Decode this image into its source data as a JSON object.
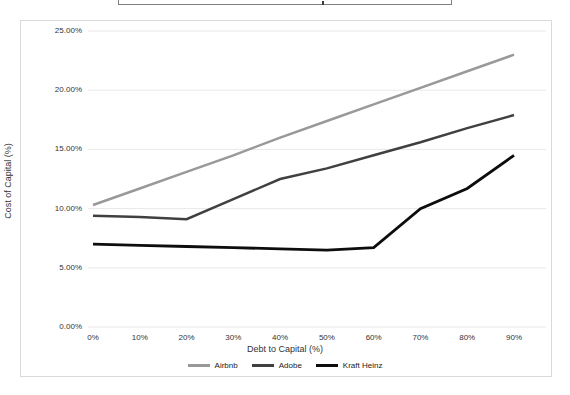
{
  "window": {
    "note_clipped_title_box": "title box cut off at top edge of screenshot"
  },
  "chart_data": {
    "type": "line",
    "title": "",
    "xlabel": "Debt to Capital (%)",
    "ylabel": "Cost of Capital (%)",
    "categories": [
      "0%",
      "10%",
      "20%",
      "30%",
      "40%",
      "50%",
      "60%",
      "70%",
      "80%",
      "90%"
    ],
    "y_tick_labels": [
      "0.00%",
      "5.00%",
      "10.00%",
      "15.00%",
      "20.00%",
      "25.00%"
    ],
    "y_tick_values": [
      0,
      5,
      10,
      15,
      20,
      25
    ],
    "ylim": [
      0,
      25
    ],
    "grid": true,
    "legend_position": "bottom",
    "colors": {
      "grid": "#e8e8e8",
      "text": "#333333",
      "panel_border": "#d9d9d9"
    },
    "series": [
      {
        "name": "Airbnb",
        "color": "#999999",
        "width": 2.5,
        "values": [
          10.3,
          11.7,
          13.1,
          14.5,
          16.0,
          17.4,
          18.8,
          20.2,
          21.6,
          23.0
        ]
      },
      {
        "name": "Adobe",
        "color": "#404040",
        "width": 2.5,
        "values": [
          9.4,
          9.3,
          9.1,
          10.8,
          12.5,
          13.4,
          14.5,
          15.6,
          16.8,
          17.9
        ]
      },
      {
        "name": "Kraft Heinz",
        "color": "#0d0d0d",
        "width": 2.8,
        "values": [
          7.0,
          6.9,
          6.8,
          6.7,
          6.6,
          6.5,
          6.7,
          10.0,
          11.7,
          14.5
        ]
      }
    ]
  }
}
